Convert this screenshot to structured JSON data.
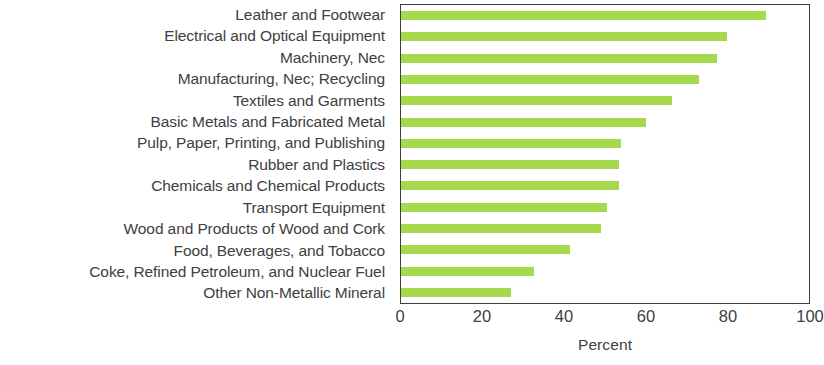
{
  "chart_data": {
    "type": "bar",
    "orientation": "horizontal",
    "title": "",
    "xlabel": "Percent",
    "ylabel": "",
    "xlim": [
      0,
      100
    ],
    "xticks": [
      0,
      20,
      40,
      60,
      80,
      100
    ],
    "xtick_labels": [
      "0",
      "20",
      "40",
      "60",
      "80",
      "100"
    ],
    "grid": false,
    "legend": null,
    "bar_color": "#a5d94e",
    "axis_color": "#3f3f3f",
    "text_color": "#414042",
    "categories": [
      "Leather and Footwear",
      "Electrical and Optical Equipment",
      "Machinery, Nec",
      "Manufacturing, Nec; Recycling",
      "Textiles and Garments",
      "Basic Metals and Fabricated Metal",
      "Pulp, Paper, Printing, and Publishing",
      "Rubber and Plastics",
      "Chemicals and Chemical Products",
      "Transport Equipment",
      "Wood and Products of Wood and Cork",
      "Food, Beverages, and Tobacco",
      "Coke, Refined Petroleum, and Nuclear Fuel",
      "Other Non-Metallic Mineral"
    ],
    "values": [
      89.5,
      80.0,
      77.5,
      73.0,
      66.5,
      60.0,
      54.0,
      53.5,
      53.5,
      50.5,
      49.0,
      41.5,
      32.5,
      27.0
    ]
  }
}
